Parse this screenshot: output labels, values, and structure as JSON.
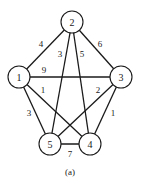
{
  "diagram": {
    "caption": "(a)",
    "nodes": [
      {
        "id": "1",
        "label": "1",
        "x": 19,
        "y": 77
      },
      {
        "id": "2",
        "label": "2",
        "x": 72,
        "y": 22
      },
      {
        "id": "3",
        "label": "3",
        "x": 121,
        "y": 77
      },
      {
        "id": "4",
        "label": "4",
        "x": 90,
        "y": 144
      },
      {
        "id": "5",
        "label": "5",
        "x": 50,
        "y": 144
      }
    ],
    "edges": [
      {
        "from": "1",
        "to": "2",
        "weight": "4",
        "lx": 41,
        "ly": 44
      },
      {
        "from": "2",
        "to": "5",
        "weight": "3",
        "lx": 59,
        "ly": 54
      },
      {
        "from": "2",
        "to": "4",
        "weight": "5",
        "lx": 82,
        "ly": 54
      },
      {
        "from": "2",
        "to": "3",
        "weight": "6",
        "lx": 100,
        "ly": 44
      },
      {
        "from": "1",
        "to": "3",
        "weight": "9",
        "lx": 44,
        "ly": 69
      },
      {
        "from": "1",
        "to": "4",
        "weight": "1",
        "lx": 42,
        "ly": 90
      },
      {
        "from": "3",
        "to": "5",
        "weight": "2",
        "lx": 98,
        "ly": 90
      },
      {
        "from": "1",
        "to": "5",
        "weight": "3",
        "lx": 28,
        "ly": 113
      },
      {
        "from": "3",
        "to": "4",
        "weight": "1",
        "lx": 113,
        "ly": 113
      },
      {
        "from": "5",
        "to": "4",
        "weight": "7",
        "lx": 70,
        "ly": 153
      }
    ],
    "node_radius": 11
  }
}
